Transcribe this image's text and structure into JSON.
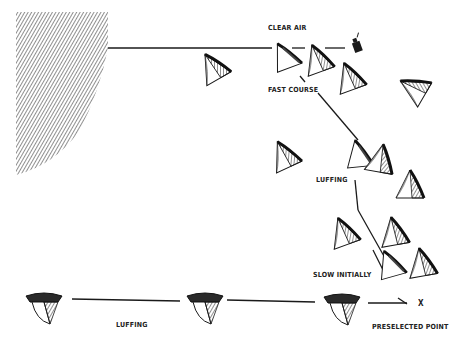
{
  "diagram": {
    "labels": {
      "clear_air": "CLEAR AIR",
      "fast_course": "FAST COURSE",
      "luffing_right": "LUFFING",
      "slow_initially": "SLOW INITIALLY",
      "luffing_bottom": "LUFFING",
      "preselected_point": "PRESELECTED POINT",
      "x_marker": "X"
    },
    "colors": {
      "ink": "#1a1a1a",
      "sail_shade": "#555555",
      "background": "#ffffff"
    }
  }
}
